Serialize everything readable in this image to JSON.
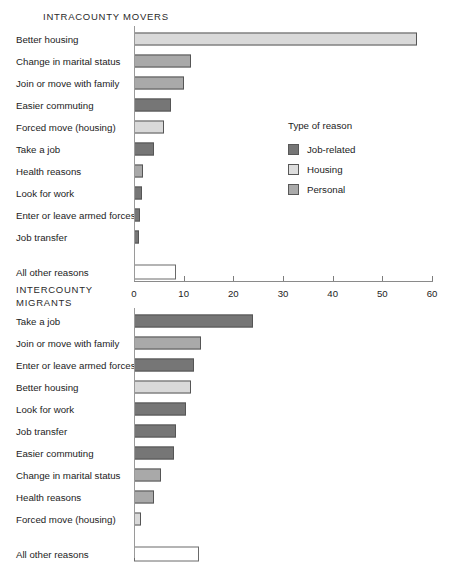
{
  "legend": {
    "title": "Type of reason",
    "items": [
      {
        "label": "Job-related",
        "key": "job",
        "color": "#767676"
      },
      {
        "label": "Housing",
        "key": "housing",
        "color": "#dddddd"
      },
      {
        "label": "Personal",
        "key": "personal",
        "color": "#aaaaaa"
      }
    ]
  },
  "axis": {
    "ticks": [
      "0",
      "10",
      "20",
      "30",
      "40",
      "50",
      "60"
    ],
    "min": 0,
    "max": 60
  },
  "sections": {
    "top": {
      "title": "INTRACOUNTY MOVERS"
    },
    "bottom": {
      "title": "INTERCOUNTY\nMIGRANTS"
    }
  },
  "chart_data": [
    {
      "type": "bar",
      "orientation": "horizontal",
      "title": "INTRACOUNTY MOVERS",
      "xlabel": "",
      "ylabel": "",
      "xlim": [
        0,
        60
      ],
      "grid": false,
      "legend_position": "middle-right",
      "categories": [
        "Better housing",
        "Change in marital status",
        "Join or move with family",
        "Easier commuting",
        "Forced move (housing)",
        "Take a job",
        "Health reasons",
        "Look for work",
        "Enter or leave armed forces",
        "Job transfer",
        "All other reasons"
      ],
      "values": [
        57.0,
        11.5,
        10.0,
        7.5,
        6.0,
        4.0,
        1.8,
        1.6,
        1.2,
        1.0,
        8.5
      ],
      "group": [
        "housing",
        "personal",
        "personal",
        "job",
        "housing",
        "job",
        "personal",
        "job",
        "job",
        "job",
        "other"
      ]
    },
    {
      "type": "bar",
      "orientation": "horizontal",
      "title": "INTERCOUNTY MIGRANTS",
      "xlabel": "",
      "ylabel": "",
      "xlim": [
        0,
        60
      ],
      "grid": false,
      "legend_position": "none",
      "categories": [
        "Take a job",
        "Join or move with family",
        "Enter or leave armed forces",
        "Better housing",
        "Look for work",
        "Job transfer",
        "Easier commuting",
        "Change in marital status",
        "Health reasons",
        "Forced move (housing)",
        "All other reasons"
      ],
      "values": [
        24.0,
        13.5,
        12.0,
        11.5,
        10.5,
        8.5,
        8.0,
        5.5,
        4.0,
        1.5,
        13.0
      ],
      "group": [
        "job",
        "personal",
        "job",
        "housing",
        "job",
        "job",
        "job",
        "personal",
        "personal",
        "housing",
        "other"
      ]
    }
  ]
}
